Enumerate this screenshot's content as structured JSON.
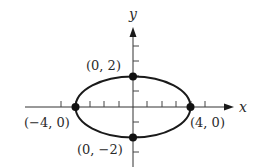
{
  "diagram": {
    "type": "ellipse-on-coordinate-plane",
    "equation_implied": "x^2/16 + y^2/4 = 1",
    "axes": {
      "x_label": "x",
      "y_label": "y",
      "x_ticks": [
        -5,
        -4,
        -3,
        -2,
        -1,
        1,
        2,
        3,
        4,
        5
      ],
      "y_ticks": [
        -3,
        -2,
        -1,
        1,
        2,
        3,
        4
      ]
    },
    "ellipse": {
      "center": [
        0,
        0
      ],
      "semi_major_x": 4,
      "semi_minor_y": 2
    },
    "points": [
      {
        "coords": [
          0,
          2
        ],
        "label": "(0, 2)"
      },
      {
        "coords": [
          -4,
          0
        ],
        "label": "(−4, 0)"
      },
      {
        "coords": [
          4,
          0
        ],
        "label": "(4, 0)"
      },
      {
        "coords": [
          0,
          -2
        ],
        "label": "(0, −2)"
      }
    ],
    "colors": {
      "stroke": "#1a1a1a",
      "background": "#ffffff"
    }
  }
}
